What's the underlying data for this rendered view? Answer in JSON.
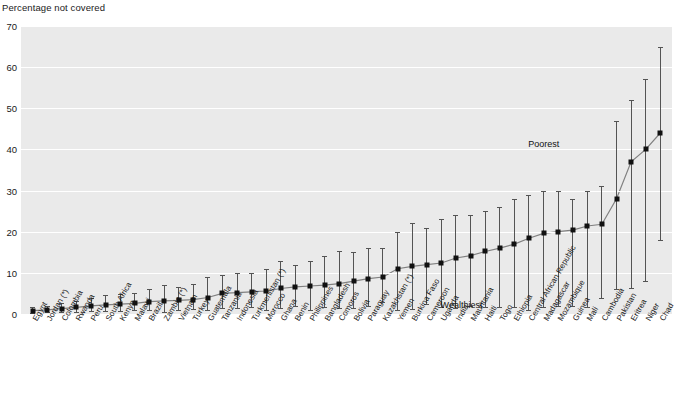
{
  "chart": {
    "axis_title": "Percentage not covered",
    "ylabel": "Percentage not covered",
    "xlabel": "",
    "title": "",
    "ylim": [
      0,
      70
    ],
    "yticks": [
      0,
      10,
      20,
      30,
      40,
      50,
      60,
      70
    ],
    "grid": true,
    "legend_position": "none",
    "annotations": [
      {
        "text": "Poorest",
        "x_index": 36,
        "y": 41
      },
      {
        "text": "Wealthiest",
        "x_index": 30,
        "y": 2
      }
    ],
    "colors": {
      "plot_background": "#eaeaea",
      "gridline": "#ffffff",
      "marker": "#111111",
      "errorbar": "#545454",
      "connector": "#808080",
      "text": "#1a1a1a"
    }
  },
  "chart_data": {
    "type": "scatter",
    "title": "",
    "xlabel": "",
    "ylabel": "Percentage not covered",
    "ylim": [
      0,
      70
    ],
    "yticks": [
      0,
      10,
      20,
      30,
      40,
      50,
      60,
      70
    ],
    "grid": true,
    "legend_position": "none",
    "series_note": "Point estimate with error bars spanning wealthiest-to-poorest quintile range",
    "categories": [
      "Egypt",
      "Jordan (*)",
      "Colombia",
      "Rwanda",
      "Peru",
      "South Africa",
      "Kenya",
      "Malawi",
      "Brazil",
      "Zambia (*)",
      "Vietnam",
      "Turkey",
      "Guatemala",
      "Tanzania",
      "Indonesia",
      "Turkmenistan (*)",
      "Morocco",
      "Ghana",
      "Benin",
      "Philippines",
      "Bangladesh",
      "Comoros",
      "Bolivia",
      "Paraguay",
      "Kazakhstan (*)",
      "Yemen",
      "Burkina Faso",
      "Cameroon",
      "Uganda",
      "India",
      "Mauritania",
      "Haiti",
      "Togo",
      "Ethiopia",
      "Central African Republic",
      "Madagascar",
      "Mozambique",
      "Guinea",
      "Mali",
      "Cambodia",
      "Pakistan",
      "Eritrea",
      "Niger",
      "Chad"
    ],
    "values": [
      0.8,
      1.0,
      1.3,
      1.6,
      2.0,
      2.2,
      2.4,
      2.6,
      3.0,
      3.2,
      3.3,
      3.5,
      4.0,
      5.0,
      5.2,
      5.4,
      5.6,
      6.2,
      6.6,
      6.8,
      7.0,
      7.4,
      8.0,
      8.6,
      9.0,
      11.0,
      11.6,
      12.0,
      12.4,
      13.6,
      14.2,
      15.2,
      16.0,
      17.0,
      18.4,
      19.6,
      20.0,
      20.4,
      21.4,
      21.8,
      28.0,
      37.0,
      40.0,
      44.0
    ],
    "err_low": [
      0.3,
      0.4,
      0.5,
      0.6,
      0.7,
      0.8,
      0.8,
      0.9,
      1.0,
      0.5,
      1.0,
      1.2,
      1.0,
      1.5,
      1.4,
      1.6,
      1.0,
      1.4,
      2.0,
      1.0,
      1.8,
      1.5,
      1.4,
      2.0,
      3.0,
      1.0,
      1.2,
      2.4,
      1.6,
      1.4,
      2.0,
      1.6,
      1.6,
      1.8,
      1.0,
      1.6,
      2.0,
      2.0,
      1.6,
      4.0,
      6.0,
      6.4,
      8.0,
      18.0
    ],
    "err_high": [
      1.6,
      2.0,
      2.6,
      3.2,
      4.0,
      4.6,
      4.8,
      5.2,
      6.0,
      7.0,
      6.6,
      7.4,
      9.0,
      9.6,
      10.0,
      10.0,
      11.0,
      13.0,
      12.0,
      13.0,
      14.0,
      15.4,
      15.0,
      16.0,
      16.0,
      20.0,
      22.0,
      21.0,
      23.0,
      24.0,
      24.0,
      25.0,
      26.0,
      28.0,
      29.0,
      30.0,
      30.0,
      28.0,
      30.0,
      31.0,
      47.0,
      52.0,
      57.0,
      65.0
    ]
  }
}
